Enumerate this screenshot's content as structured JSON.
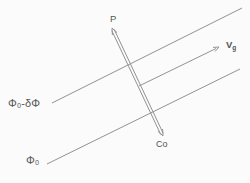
{
  "figure": {
    "background": "#fbfbfb",
    "line_color": "#929292",
    "text_color": "#555555",
    "labels": {
      "p": {
        "text": "P",
        "x": 110,
        "y": 14
      },
      "vg": {
        "main": "V",
        "sub": "g",
        "x": 226,
        "y": 40
      },
      "co": {
        "text": "Co",
        "x": 156,
        "y": 140
      },
      "phase_upper": {
        "text": "Φ₀-δΦ",
        "x": 8,
        "y": 98
      },
      "phase_lower": {
        "text": "Φ₀",
        "x": 26,
        "y": 155
      }
    },
    "segments": [
      {
        "name": "wavefront-line-upper",
        "x1": 52,
        "y1": 103,
        "x2": 242,
        "y2": 8
      },
      {
        "name": "wavefront-line-lower",
        "x1": 47,
        "y1": 164,
        "x2": 240,
        "y2": 69
      },
      {
        "name": "group-velocity-ray",
        "x1": 139,
        "y1": 86,
        "x2": 216,
        "y2": 48.5
      },
      {
        "name": "phase-band-edge-left",
        "x1": 111.8,
        "y1": 30.6,
        "x2": 160.8,
        "y2": 134.6
      },
      {
        "name": "phase-band-edge-right",
        "x1": 114.2,
        "y1": 29.4,
        "x2": 163.2,
        "y2": 133.4
      }
    ],
    "arrowheads": [
      {
        "name": "vg-arrowhead",
        "points": "213,47.4 219,47 215,51.5"
      },
      {
        "name": "band-top-arrowhead",
        "points": "112.4,35 112,28 117.1,32.7"
      },
      {
        "name": "band-bottom-arrowhead",
        "points": "162.6,129 163,136 157.9,131.3"
      }
    ]
  }
}
